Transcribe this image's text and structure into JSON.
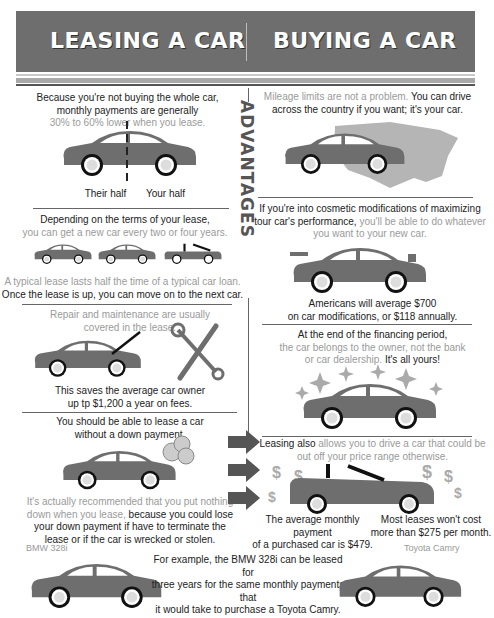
{
  "header": {
    "left_title": "LEASING A CAR",
    "right_title": "BUYING A CAR"
  },
  "side_label": "ADVANTAGES",
  "colors": {
    "header_bg": "#6e6e6e",
    "car_body": "#6e6e6e",
    "light_text": "#9a9a9a",
    "dark_text": "#222222"
  },
  "leasing": {
    "payments": {
      "line1": "Because you're not buying the whole car,",
      "line2": "monthly payments are generally",
      "line3": "30% to 60% lower when you lease.",
      "label_left": "Their half",
      "label_right": "Your half"
    },
    "new_car": {
      "line1": "Depending on the terms of your lease,",
      "line2": "you can get a new car every two or four years.",
      "line3": "A typical lease lasts half the time of a typical car loan.",
      "line4": "Once the lease is up, you can move on to the next car."
    },
    "repair": {
      "line1": "Repair and maintenance are usually",
      "line2": "covered in the lease.",
      "line3": "This saves the average car owner",
      "line4": "up tp $1,200 a year on fees."
    },
    "down_payment": {
      "line1": "You should be able to lease a car",
      "line2": "without a down payment.",
      "line3": "It's actually recommended that you put nothing",
      "line4a": "down when you lease,",
      "line4b": " because you could lose",
      "line5": "your down payment if have to terminate the",
      "line6": "lease or if the car is wrecked or stolen."
    }
  },
  "buying": {
    "mileage": {
      "line1a": "Mileage limits are not a problem.",
      "line1b": " You can drive",
      "line2": "across the country if you want; it's your car."
    },
    "mods": {
      "line1": "If you're into cosmetic modifications of maximizing",
      "line2a": "tour car's performance,",
      "line2b": " you'll be able to do whatever",
      "line3": "you want to your new car.",
      "line4": "Americans will average $700",
      "line5": "on car modifications, or $118 annually."
    },
    "ownership": {
      "line1": "At the end of the financing period,",
      "line2": "the car belongs to the owner, not the bank",
      "line3a": "or car dealership.",
      "line3b": " It's all yours!"
    },
    "price_range": {
      "line1a": "Leasing also",
      "line1b": " allows you to drive a car that could be",
      "line2": "out off your price range otherwise.",
      "left_stat1": "The average monthly payment",
      "left_stat2": "of a purchased car is $479.",
      "right_stat1": "Most leases won't cost",
      "right_stat2": "more than $275 per month."
    }
  },
  "example": {
    "left_car_label": "BMW 328i",
    "right_car_label": "Toyota Camry",
    "line1": "For example, the BMW 328i can be leased for",
    "line2": "three years for the same monthly payments that",
    "line3": "it would take to purchase a Toyota Camry."
  }
}
